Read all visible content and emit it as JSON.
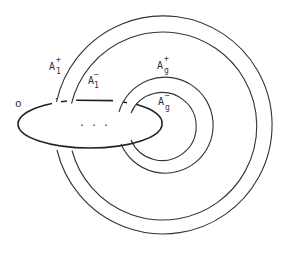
{
  "diagram": {
    "stroke_color": "#333333",
    "background": "#ffffff",
    "labels": {
      "o": "o",
      "a1_plus_base": "A",
      "a1_plus_sub": "1",
      "a1_plus_sup": "+",
      "a1_minus_base": "A",
      "a1_minus_sub": "1",
      "a1_minus_sup": "−",
      "ag_plus_base": "A",
      "ag_plus_sub": "g",
      "ag_plus_sup": "+",
      "ag_minus_base": "A",
      "ag_minus_sub": "g",
      "ag_minus_sup": "−",
      "ellipsis": ". . ."
    },
    "circles": [
      {
        "name": "A1+",
        "cx": 163,
        "cy": 126,
        "r": 109
      },
      {
        "name": "A1-",
        "cx": 163,
        "cy": 126,
        "r": 94
      },
      {
        "name": "Ag+",
        "cx": 165,
        "cy": 126,
        "r": 48
      },
      {
        "name": "Ag-",
        "cx": 163,
        "cy": 126,
        "r": 34
      }
    ],
    "ellipse": {
      "name": "o",
      "cx": 90,
      "cy": 124,
      "rx": 72,
      "ry": 24
    }
  }
}
